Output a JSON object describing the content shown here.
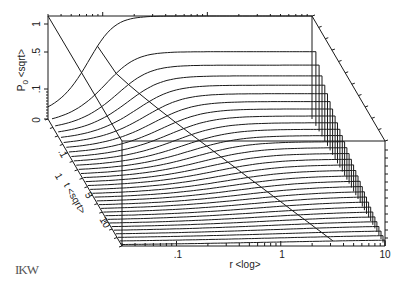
{
  "chart_data": {
    "type": "waterfall-3d-line",
    "title": "",
    "xlabel": "r <log>",
    "ylabel": "P0 <sqrt>",
    "zlabel": "t <sqrt>",
    "x_ticks": [
      ".1",
      "1",
      "10"
    ],
    "x_range": [
      0.03,
      10
    ],
    "y_ticks": [
      "0",
      ".1",
      ".5",
      "1"
    ],
    "y_range": [
      0,
      1
    ],
    "z_ticks": [
      "0",
      ".1",
      "1",
      "5",
      "10"
    ],
    "z_range": [
      0,
      12
    ],
    "grid": false,
    "legend": null,
    "num_traces": 32
  },
  "axes": {
    "y_label_main": "P",
    "y_label_sub": "0",
    "y_label_rest": " <sqrt>",
    "x_label": "r  <log>",
    "z_label": "t  <sqrt>",
    "y_tick_1": "1",
    "y_tick_05": ".5",
    "y_tick_01": ".1",
    "y_tick_0": "0",
    "x_tick_01": ".1",
    "x_tick_1": "1",
    "x_tick_10": "10",
    "z_tick_01": ".1",
    "z_tick_1": "1",
    "z_tick_5": "5",
    "z_tick_10": "10"
  },
  "logo": "IKW"
}
